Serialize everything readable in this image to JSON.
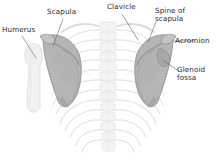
{
  "figure": {
    "view": "Posterior view of the shoulder girdle",
    "background_color": "#ffffff",
    "label_color": "#2b2b2b",
    "leader_line_color": "#6e6e6e",
    "scapula_fill": "#b9b9b9",
    "scapula_shadow": "#8f8f8f",
    "ribcage_color": "#e8e8e8",
    "humerus_color": "#ededed"
  },
  "labels": [
    {
      "id": "humerus",
      "text": "Humerus"
    },
    {
      "id": "scapula",
      "text": "Scapula"
    },
    {
      "id": "clavicle",
      "text": "Clavicle"
    },
    {
      "id": "spine",
      "text": "Spine of\nscapula"
    },
    {
      "id": "acromion",
      "text": "Acromion"
    },
    {
      "id": "glenoid",
      "text": "Glenoid\nfossa"
    }
  ],
  "structures": [
    {
      "name": "left-scapula",
      "description": "Shaded triangular scapular blade, viewer left"
    },
    {
      "name": "right-scapula",
      "description": "Shaded triangular scapular blade, viewer right"
    },
    {
      "name": "left-humerus",
      "description": "Faint humeral shaft with head, viewer left"
    },
    {
      "name": "vertebral-column",
      "description": "Faint thoracic vertebrae in midline"
    },
    {
      "name": "ribcage",
      "description": "Faint posterior rib pairs"
    },
    {
      "name": "clavicle-bone",
      "description": "Faint clavicle crossing above scapula"
    }
  ]
}
